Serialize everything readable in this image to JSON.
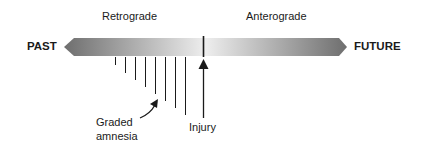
{
  "labels": {
    "retrograde": "Retrograde",
    "anterograde": "Anterograde",
    "past": "PAST",
    "future": "FUTURE",
    "graded_line1": "Graded",
    "graded_line2": "amnesia",
    "injury": "Injury"
  },
  "colors": {
    "arrow_dark": "#6e6e6e",
    "arrow_light": "#f0f0f0",
    "line": "#1a1a1a"
  }
}
